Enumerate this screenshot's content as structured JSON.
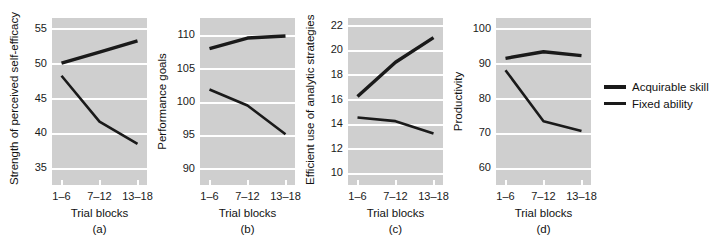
{
  "figure": {
    "background_color": "#ffffff",
    "plot_background_color": "#cfcfcf",
    "gridline_color": "#ffffff",
    "line_color": "#1a1a1a"
  },
  "legend": {
    "position": "right",
    "entries": [
      {
        "label": "Acquirable skill",
        "style": "thick",
        "color": "#1a1a1a"
      },
      {
        "label": "Fixed ability",
        "style": "thin",
        "color": "#1a1a1a"
      }
    ]
  },
  "chart_data": [
    {
      "type": "line",
      "panel": "(a)",
      "title": "",
      "xlabel": "Trial blocks",
      "ylabel": "Strength of perceived self-efficacy",
      "categories": [
        "1–6",
        "7–12",
        "13–18"
      ],
      "yticks": [
        35,
        40,
        45,
        50,
        55
      ],
      "ylim": [
        32.5,
        56.5
      ],
      "grid": true,
      "series": [
        {
          "name": "Acquirable skill",
          "values": [
            50.0,
            51.6,
            53.2
          ]
        },
        {
          "name": "Fixed ability",
          "values": [
            48.2,
            41.6,
            38.4
          ]
        }
      ]
    },
    {
      "type": "line",
      "panel": "(b)",
      "title": "",
      "xlabel": "Trial blocks",
      "ylabel": "Performance goals",
      "categories": [
        "1–6",
        "7–12",
        "13–18"
      ],
      "yticks": [
        90,
        95,
        100,
        105,
        110
      ],
      "ylim": [
        87.5,
        112.5
      ],
      "grid": true,
      "series": [
        {
          "name": "Acquirable skill",
          "values": [
            107.9,
            109.5,
            109.8
          ]
        },
        {
          "name": "Fixed ability",
          "values": [
            101.8,
            99.4,
            95.1
          ]
        }
      ]
    },
    {
      "type": "line",
      "panel": "(c)",
      "title": "",
      "xlabel": "Trial blocks",
      "ylabel": "Efficient use of analytic strategies",
      "categories": [
        "1–6",
        "7–12",
        "13–18"
      ],
      "yticks": [
        10,
        12,
        14,
        16,
        18,
        20,
        22
      ],
      "ylim": [
        9.0,
        22.6
      ],
      "grid": true,
      "series": [
        {
          "name": "Acquirable skill",
          "values": [
            16.2,
            19.0,
            21.0
          ]
        },
        {
          "name": "Fixed ability",
          "values": [
            14.5,
            14.2,
            13.2
          ]
        }
      ]
    },
    {
      "type": "line",
      "panel": "(d)",
      "title": "",
      "xlabel": "Trial blocks",
      "ylabel": "Productivity",
      "categories": [
        "1–6",
        "7–12",
        "13–18"
      ],
      "yticks": [
        60,
        70,
        80,
        90,
        100
      ],
      "ylim": [
        55,
        103
      ],
      "grid": true,
      "series": [
        {
          "name": "Acquirable skill",
          "values": [
            91.4,
            93.3,
            92.2
          ]
        },
        {
          "name": "Fixed ability",
          "values": [
            88.0,
            73.3,
            70.5
          ]
        }
      ]
    }
  ]
}
